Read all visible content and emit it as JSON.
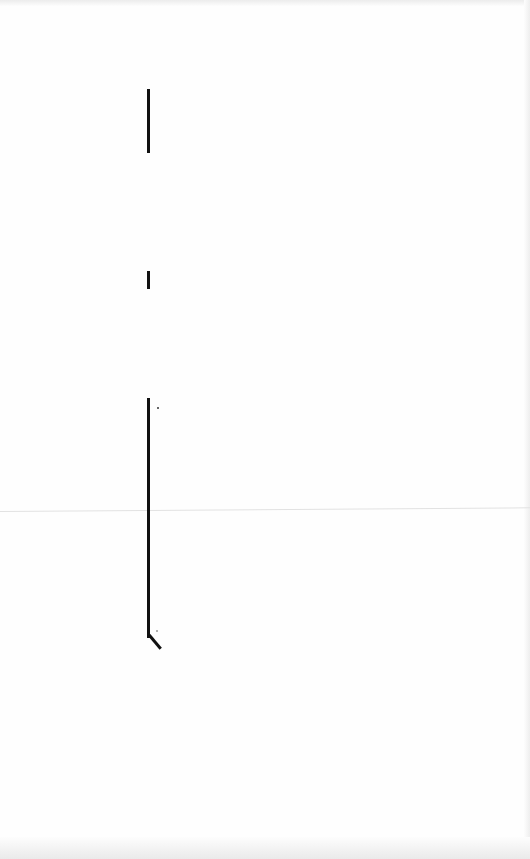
{
  "document": {
    "type": "scanned-page",
    "text": "",
    "change_bars": [
      {
        "position": "left-margin",
        "top": 89,
        "height": 64
      },
      {
        "position": "left-margin",
        "top": 271,
        "height": 18
      },
      {
        "position": "left-margin",
        "top": 398,
        "height": 256
      }
    ],
    "colors": {
      "paper": "#fefefe",
      "ink": "#111111"
    }
  }
}
